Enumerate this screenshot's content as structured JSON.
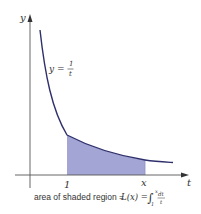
{
  "figure": {
    "y_axis_label": "y",
    "t_axis_label": "t",
    "curve_label_lhs": "y =",
    "curve_label_num": "1",
    "curve_label_den": "t",
    "tick_one_label": "1",
    "tick_x_label": "x",
    "caption_prefix": "area of shaded region = ",
    "caption_fn": "L(x) = ",
    "caption_integral": "∫",
    "caption_upper": "x",
    "caption_lower": "1",
    "caption_num": "dt",
    "caption_den": "t",
    "colors": {
      "curve": "#2e2f6b",
      "shade": "#a3a6d4",
      "axis": "#555555",
      "text": "#333333"
    }
  }
}
